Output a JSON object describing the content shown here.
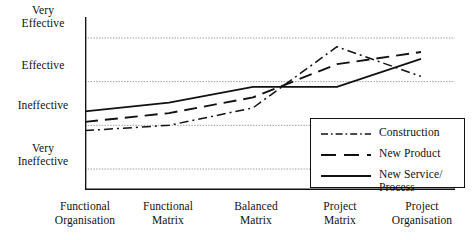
{
  "chart_data": {
    "type": "line",
    "title": "",
    "xlabel": "",
    "ylabel": "",
    "grid": true,
    "legend_position": "bottom-right",
    "categories": [
      "Functional\nOrganisation",
      "Functional\nMatrix",
      "Balanced\nMatrix",
      "Project\nMatrix",
      "Project\nOrganisation"
    ],
    "y_tick_labels": [
      "Very\nEffective",
      "Effective",
      "Ineffective",
      "Very\nIneffective"
    ],
    "y_tick_values": [
      100,
      75,
      50,
      25
    ],
    "ylim": [
      13,
      112
    ],
    "series": [
      {
        "name": "Construction",
        "style": "dash-dot",
        "values": [
          47,
          50,
          60,
          95,
          78
        ]
      },
      {
        "name": "New Product",
        "style": "dashed",
        "values": [
          52,
          57,
          66,
          85,
          92
        ]
      },
      {
        "name": "New Service/\nProcess",
        "style": "solid",
        "values": [
          58,
          63,
          72,
          72,
          88
        ]
      }
    ]
  },
  "legend": {
    "items": [
      {
        "label": "Construction",
        "style": "dash-dot"
      },
      {
        "label": "New Product",
        "style": "dashed"
      },
      {
        "label": "New Service/\nProcess",
        "style": "solid"
      }
    ]
  },
  "colors": {
    "line": "#111111",
    "grid": "#9a9a9a",
    "axis": "#111111",
    "background": "#ffffff"
  }
}
